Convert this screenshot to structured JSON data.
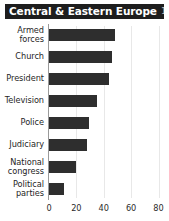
{
  "title": {
    "main": "Central & Eastern Europe",
    "period": "1997–98"
  },
  "colors": {
    "title_bar_background": "#1d1d1d",
    "title_text": "#ffffff",
    "period_text": "#bdbdbd",
    "bar": "#2e2e2e",
    "gridline": "#e8e8e8",
    "axis_line": "#9a9a9a",
    "background": "#ffffff"
  },
  "chart_data": {
    "type": "bar",
    "orientation": "horizontal",
    "title": "Central & Eastern Europe 1997–98",
    "subtitle": "1997–98",
    "categories": [
      "Armed forces",
      "Church",
      "President",
      "Television",
      "Police",
      "Judiciary",
      "National congress",
      "Political parties"
    ],
    "category_lines": [
      [
        "Armed",
        "forces"
      ],
      [
        "Church"
      ],
      [
        "President"
      ],
      [
        "Television"
      ],
      [
        "Police"
      ],
      [
        "Judiciary"
      ],
      [
        "National",
        "congress"
      ],
      [
        "Political",
        "parties"
      ]
    ],
    "values": [
      48,
      46,
      44,
      35,
      29,
      28,
      20,
      11
    ],
    "xlabel": "",
    "ylabel": "",
    "xlim": [
      0,
      80
    ],
    "xticks": [
      0,
      20,
      40,
      60,
      80
    ],
    "xtick_labels": [
      "0",
      "20",
      "40",
      "60",
      "80"
    ],
    "grid": true,
    "grid_axis": "x",
    "legend": false
  }
}
